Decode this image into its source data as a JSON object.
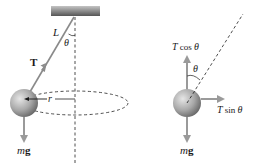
{
  "figure": {
    "colors": {
      "string": "#8a8a8a",
      "arrow": "#9a9a9a",
      "dashed": "#3a3a3a",
      "ball_light": "#d9d9d9",
      "ball_dark": "#6e6e6e",
      "ceiling_light": "#b5b5b5",
      "ceiling_dark": "#5a5a5a",
      "text": "#1a1a1a"
    },
    "left_panel": {
      "name": "conical-pendulum",
      "labels": {
        "length": "L",
        "angle": "θ",
        "tension": "T",
        "radius": "r",
        "weight_m": "m",
        "weight_g": "g"
      }
    },
    "right_panel": {
      "name": "free-body-diagram",
      "labels": {
        "vertical_component_T": "T",
        "vertical_component_fn": " cos ",
        "vertical_component_theta": "θ",
        "horizontal_component_T": "T",
        "horizontal_component_fn": " sin ",
        "horizontal_component_theta": "θ",
        "angle": "θ",
        "weight_m": "m",
        "weight_g": "g"
      }
    }
  }
}
